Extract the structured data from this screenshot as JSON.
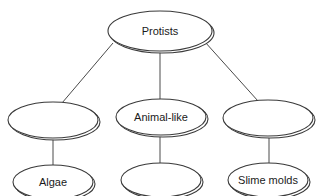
{
  "diagram": {
    "type": "hierarchy",
    "root": {
      "id": "protists",
      "label": "Protists",
      "cx": 160,
      "cy": 31,
      "rx": 52,
      "ry": 20
    },
    "level1": [
      {
        "id": "plant-like",
        "label": "",
        "cx": 53,
        "cy": 120,
        "rx": 45,
        "ry": 18
      },
      {
        "id": "animal-like",
        "label": "Animal-like",
        "cx": 161,
        "cy": 117,
        "rx": 45,
        "ry": 18
      },
      {
        "id": "fungus-like",
        "label": "",
        "cx": 268,
        "cy": 118,
        "rx": 45,
        "ry": 18
      }
    ],
    "level2": [
      {
        "id": "algae",
        "label": "Algae",
        "parent": "plant-like",
        "cx": 53,
        "cy": 182,
        "rx": 40,
        "ry": 17
      },
      {
        "id": "blank-animal",
        "label": "",
        "parent": "animal-like",
        "cx": 161,
        "cy": 180,
        "rx": 40,
        "ry": 17
      },
      {
        "id": "slime-molds",
        "label": "Slime molds",
        "parent": "fungus-like",
        "cx": 268,
        "cy": 180,
        "rx": 40,
        "ry": 17
      }
    ]
  }
}
